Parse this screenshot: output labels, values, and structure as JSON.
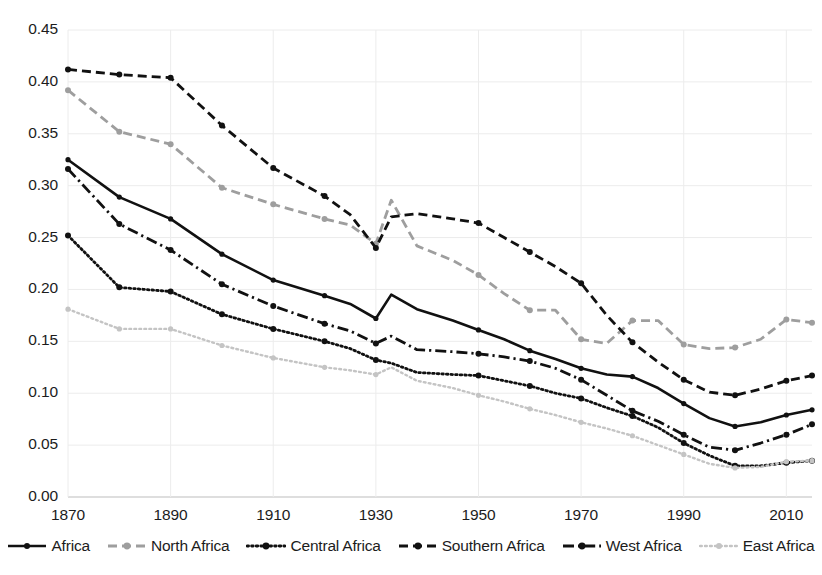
{
  "chart_data": {
    "type": "line",
    "title": "",
    "xlabel": "",
    "ylabel": "",
    "xlim": [
      1870,
      2015
    ],
    "ylim": [
      0.0,
      0.45
    ],
    "grid": true,
    "legend_position": "bottom",
    "y_ticks": [
      "0.00",
      "0.05",
      "0.10",
      "0.15",
      "0.20",
      "0.25",
      "0.30",
      "0.35",
      "0.40",
      "0.45"
    ],
    "y_tick_values": [
      0.0,
      0.05,
      0.1,
      0.15,
      0.2,
      0.25,
      0.3,
      0.35,
      0.4,
      0.45
    ],
    "x_ticks": [
      "1870",
      "1890",
      "1910",
      "1930",
      "1950",
      "1970",
      "1990",
      "2010"
    ],
    "x_tick_values": [
      1870,
      1890,
      1910,
      1930,
      1950,
      1970,
      1990,
      2010
    ],
    "x": [
      1870,
      1880,
      1890,
      1900,
      1910,
      1920,
      1925,
      1930,
      1933,
      1938,
      1945,
      1950,
      1955,
      1960,
      1965,
      1970,
      1975,
      1980,
      1985,
      1990,
      1995,
      2000,
      2005,
      2010,
      2015
    ],
    "series": [
      {
        "name": "Africa",
        "style": "solid",
        "color": "#111111",
        "values": [
          0.325,
          0.289,
          0.268,
          0.234,
          0.209,
          0.194,
          0.186,
          0.172,
          0.195,
          0.181,
          0.17,
          0.161,
          0.152,
          0.141,
          0.133,
          0.124,
          0.118,
          0.116,
          0.105,
          0.09,
          0.076,
          0.068,
          0.072,
          0.079,
          0.084
        ]
      },
      {
        "name": "North Africa",
        "style": "dashed",
        "color": "#9e9e9e",
        "values": [
          0.392,
          0.352,
          0.34,
          0.298,
          0.282,
          0.268,
          0.262,
          0.244,
          0.286,
          0.242,
          0.228,
          0.214,
          0.196,
          0.18,
          0.18,
          0.152,
          0.148,
          0.17,
          0.17,
          0.147,
          0.143,
          0.144,
          0.152,
          0.171,
          0.168
        ]
      },
      {
        "name": "Central Africa",
        "style": "dotted",
        "color": "#111111",
        "values": [
          0.252,
          0.202,
          0.198,
          0.176,
          0.162,
          0.15,
          0.143,
          0.132,
          0.129,
          0.12,
          0.118,
          0.117,
          0.112,
          0.107,
          0.1,
          0.095,
          0.086,
          0.078,
          0.067,
          0.052,
          0.04,
          0.03,
          0.03,
          0.033,
          0.035
        ]
      },
      {
        "name": "Southern Africa",
        "style": "dashed",
        "color": "#111111",
        "values": [
          0.412,
          0.407,
          0.404,
          0.358,
          0.317,
          0.29,
          0.272,
          0.24,
          0.27,
          0.273,
          0.268,
          0.264,
          0.25,
          0.236,
          0.222,
          0.206,
          0.175,
          0.149,
          0.13,
          0.113,
          0.101,
          0.098,
          0.104,
          0.112,
          0.117
        ]
      },
      {
        "name": "West Africa",
        "style": "dashdot",
        "color": "#111111",
        "values": [
          0.316,
          0.263,
          0.238,
          0.205,
          0.184,
          0.167,
          0.16,
          0.148,
          0.155,
          0.142,
          0.14,
          0.138,
          0.135,
          0.131,
          0.124,
          0.113,
          0.098,
          0.083,
          0.073,
          0.06,
          0.048,
          0.045,
          0.052,
          0.06,
          0.07
        ]
      },
      {
        "name": "East Africa",
        "style": "dotted-light",
        "color": "#c4c4c4",
        "values": [
          0.181,
          0.162,
          0.162,
          0.146,
          0.134,
          0.125,
          0.122,
          0.118,
          0.125,
          0.112,
          0.105,
          0.098,
          0.092,
          0.085,
          0.079,
          0.072,
          0.066,
          0.059,
          0.05,
          0.041,
          0.032,
          0.028,
          0.029,
          0.034,
          0.035
        ]
      }
    ]
  },
  "legend": {
    "items": [
      {
        "label": "Africa",
        "key": "solid-line-key"
      },
      {
        "label": "North Africa",
        "key": "dashed-gray-line-key"
      },
      {
        "label": "Central Africa",
        "key": "dotted-line-key"
      },
      {
        "label": "Southern Africa",
        "key": "dashed-line-key"
      },
      {
        "label": "West Africa",
        "key": "dashdot-line-key"
      },
      {
        "label": "East Africa",
        "key": "dotted-light-line-key"
      }
    ]
  }
}
